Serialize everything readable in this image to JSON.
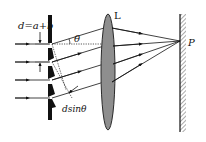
{
  "diagram": {
    "labels": {
      "grating_constant": "d=a+b",
      "angle": "θ",
      "lens": "L",
      "point": "P",
      "path_difference": "dsinθ"
    },
    "colors": {
      "ink": "#111111",
      "lens_fill": "#8e8e8e",
      "lens_stroke": "#2a2a2a",
      "screen_fill": "#cfcfcf",
      "background": "#ffffff"
    },
    "elements": {
      "incident_rays": 4,
      "grating_slits": 5,
      "diffracted_rays": 4,
      "converging_rays": 4
    }
  }
}
